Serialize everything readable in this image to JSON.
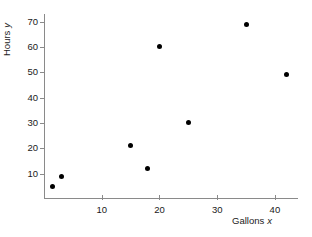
{
  "chart_data": {
    "type": "scatter",
    "title": "",
    "xlabel": "Gallons x",
    "ylabel": "Hours y",
    "xlabel_text": "Gallons",
    "xlabel_var": "x",
    "ylabel_text": "Hours",
    "ylabel_var": "y",
    "xlim": [
      0,
      44
    ],
    "ylim": [
      0,
      73
    ],
    "grid": false,
    "legend": null,
    "marker_color": "#000000",
    "axis_color": "#8a8a8a",
    "background_color": "#ffffff",
    "xticks": [
      10,
      20,
      30,
      40
    ],
    "xticklabels": [
      "10",
      "20",
      "30",
      "40"
    ],
    "yticks": [
      10,
      20,
      30,
      40,
      50,
      60,
      70
    ],
    "yticklabels": [
      "10",
      "20",
      "30",
      "40",
      "50",
      "60",
      "70"
    ],
    "x": [
      1.5,
      3,
      15,
      18,
      20,
      25,
      35,
      42
    ],
    "y": [
      5,
      9,
      21,
      12,
      60,
      30,
      69,
      49
    ],
    "points": [
      {
        "x": 1.5,
        "y": 5
      },
      {
        "x": 3,
        "y": 9
      },
      {
        "x": 15,
        "y": 21
      },
      {
        "x": 18,
        "y": 12
      },
      {
        "x": 20,
        "y": 60
      },
      {
        "x": 25,
        "y": 30
      },
      {
        "x": 35,
        "y": 69
      },
      {
        "x": 42,
        "y": 49
      }
    ]
  }
}
